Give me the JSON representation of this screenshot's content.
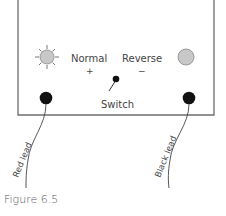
{
  "figure": {
    "caption": "Figure 6.5",
    "labels": {
      "normal": "Normal",
      "normal_sign": "+",
      "reverse": "Reverse",
      "reverse_sign": "−",
      "switch": "Switch",
      "red_lead": "Red lead",
      "black_lead": "Black lead"
    },
    "icons": {
      "lit_bulb": "lit-bulb-icon",
      "unlit_bulb": "unlit-bulb-icon",
      "switch": "toggle-switch-icon",
      "red_terminal": "terminal-icon",
      "black_terminal": "terminal-icon"
    },
    "colors": {
      "outline": "#6e6e6e",
      "bulb_fill": "#c8c8c8",
      "terminal": "#111111",
      "text": "#444444"
    }
  }
}
